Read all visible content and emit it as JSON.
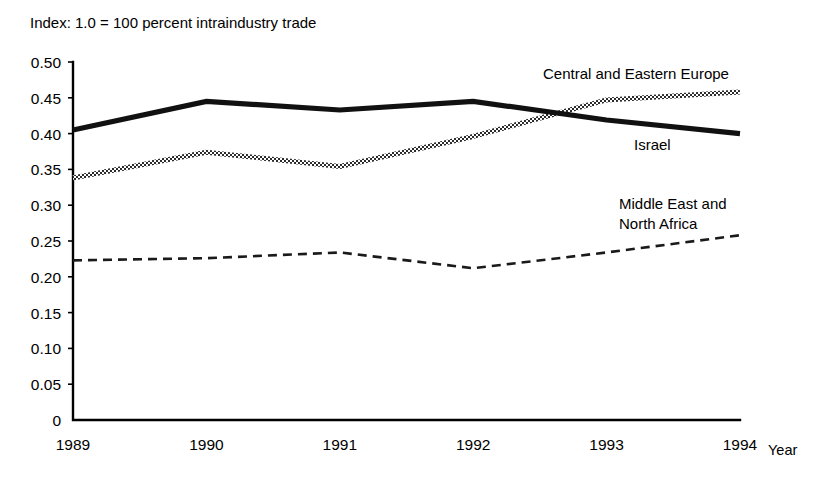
{
  "figure": {
    "index_note": "Index: 1.0 = 100 percent  intraindustry trade",
    "x_axis_name": "Year"
  },
  "chart_data": {
    "type": "line",
    "title": "Index: 1.0 = 100 percent  intraindustry trade",
    "xlabel": "Year",
    "ylabel": "",
    "x": [
      1989,
      1990,
      1991,
      1992,
      1993,
      1994
    ],
    "xtick_labels": [
      "1989",
      "1990",
      "1991",
      "1992",
      "1993",
      "1994"
    ],
    "ytick_labels": [
      "0.50",
      "0.45",
      "0.40",
      "0.35",
      "0.30",
      "0.25",
      "0.20",
      "0.15",
      "0.10",
      "0.05",
      "0"
    ],
    "ytick_values": [
      0.5,
      0.45,
      0.4,
      0.35,
      0.3,
      0.25,
      0.2,
      0.15,
      0.1,
      0.05,
      0
    ],
    "ylim": [
      0,
      0.5
    ],
    "xlim": [
      1989,
      1994
    ],
    "grid": false,
    "legend_position": "inline-annotations",
    "series": [
      {
        "name": "Israel",
        "style": "thick-solid",
        "label": "Israel",
        "values": [
          0.405,
          0.445,
          0.433,
          0.445,
          0.419,
          0.4
        ]
      },
      {
        "name": "Central and Eastern Europe",
        "style": "hatched",
        "label": "Central and Eastern Europe",
        "values": [
          0.338,
          0.374,
          0.354,
          0.396,
          0.447,
          0.458
        ]
      },
      {
        "name": "Middle East and North Africa",
        "style": "dashed",
        "label": "Middle East and North Africa",
        "values": [
          0.223,
          0.226,
          0.234,
          0.212,
          0.234,
          0.258
        ]
      }
    ],
    "annotations": [
      {
        "text": "Central and Eastern Europe",
        "x": 543,
        "y": 79
      },
      {
        "text": "Israel",
        "x": 634,
        "y": 150
      },
      {
        "text": "Middle East and",
        "x": 619,
        "y": 209
      },
      {
        "text": "North Africa",
        "x": 619,
        "y": 229
      }
    ]
  }
}
